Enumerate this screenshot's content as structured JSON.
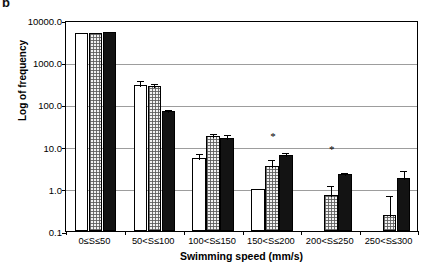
{
  "panel": {
    "label": "b"
  },
  "chart_data": {
    "type": "bar",
    "title": "",
    "xlabel": "Swimming speed (mm/s)",
    "ylabel": "Log of frequency",
    "yscale": "log",
    "ylim": [
      0.1,
      10000
    ],
    "yticks": [
      0.1,
      1.0,
      10.0,
      100.0,
      1000.0,
      10000.0
    ],
    "ytick_labels": [
      "0.1",
      "1.0",
      "10.0",
      "100.0",
      "1000.0",
      "10000.0"
    ],
    "grid": true,
    "legend": "none",
    "categories": [
      "0≤S≤50",
      "50<S≤100",
      "100<S≤150",
      "150<S≤200",
      "200<S≤250",
      "250<S≤300"
    ],
    "series": [
      {
        "name": "white",
        "fill": "white",
        "values": [
          5000,
          290,
          5.4,
          1.0,
          null,
          null
        ],
        "err_low": [
          0,
          70,
          1.4,
          0,
          null,
          null
        ],
        "err_high": [
          0,
          110,
          1.9,
          0,
          null,
          null
        ]
      },
      {
        "name": "stippled",
        "fill": "stipple-gray",
        "values": [
          5000,
          280,
          17.5,
          3.4,
          0.72,
          0.24
        ],
        "err_low": [
          0,
          40,
          3.5,
          1.2,
          0.28,
          0.1
        ],
        "err_high": [
          0,
          55,
          5.0,
          2.0,
          0.55,
          0.5
        ]
      },
      {
        "name": "black",
        "fill": "black",
        "values": [
          5300,
          68,
          16.0,
          6.3,
          2.3,
          1.8
        ],
        "err_low": [
          0,
          0,
          3.0,
          1.2,
          0.25,
          0.5
        ],
        "err_high": [
          0,
          12,
          4.5,
          1.7,
          0.3,
          1.1
        ]
      }
    ],
    "annotations": [
      {
        "text": "*",
        "category": "150<S≤200",
        "note": "significance marker above group 4"
      },
      {
        "text": "*",
        "category": "200<S≤250",
        "note": "significance marker above group 5"
      }
    ]
  }
}
